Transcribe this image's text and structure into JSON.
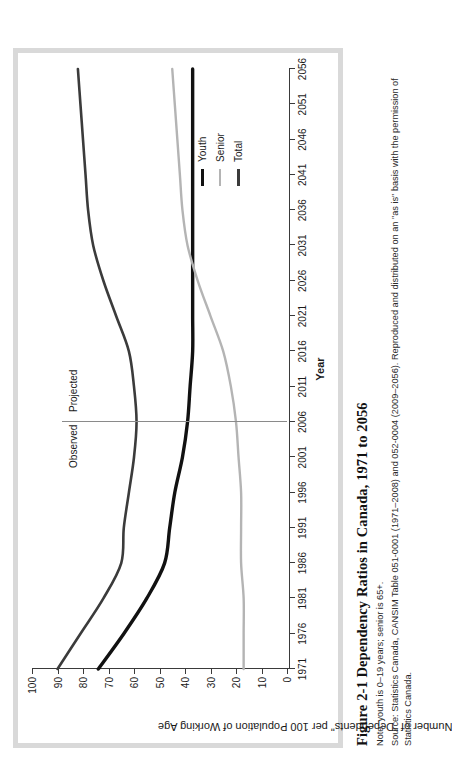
{
  "figure": {
    "title": "Figure 2-1  Dependency Ratios in Canada, 1971 to 2056",
    "note": "Note: youth is 0–19 years; senior is 65+.",
    "source": "Source: Statistics Canada, CANSIM Table 051-0001 (1971–2008) and 052-0004 (2009–2056). Reproduced and distributed on an \"as is\" basis with the permission of Statistics Canada."
  },
  "annotations": {
    "observed": "Observed",
    "projected": "Projected",
    "divider_year": 2006
  },
  "colors": {
    "total": "#3b3b3b",
    "youth": "#111111",
    "senior": "#b4b4b4",
    "axis": "#3a3a3a",
    "frame": "#d9d9d9",
    "divider": "#8a8a8a"
  },
  "chart_data": {
    "type": "line",
    "title": "Dependency Ratios in Canada, 1971 to 2056",
    "xlabel": "Year",
    "ylabel": "Number of \"Dependents\" per 100 Population of Working Age",
    "xlim": [
      1971,
      2056
    ],
    "ylim": [
      0,
      100
    ],
    "xticks": [
      1971,
      1976,
      1981,
      1986,
      1991,
      1996,
      2001,
      2006,
      2011,
      2016,
      2021,
      2026,
      2031,
      2036,
      2041,
      2046,
      2051,
      2056
    ],
    "yticks": [
      0,
      10,
      20,
      30,
      40,
      50,
      60,
      70,
      80,
      90,
      100
    ],
    "grid": false,
    "legend_position": "inside-right",
    "x": [
      1971,
      1976,
      1981,
      1986,
      1991,
      1996,
      2001,
      2006,
      2011,
      2016,
      2021,
      2026,
      2031,
      2036,
      2041,
      2046,
      2051,
      2056
    ],
    "series": [
      {
        "name": "Total",
        "color": "#3b3b3b",
        "values": [
          90,
          81,
          72,
          65,
          64,
          62,
          60,
          59,
          60,
          62,
          67,
          72,
          76,
          78,
          79,
          80,
          81,
          82
        ]
      },
      {
        "name": "Youth",
        "color": "#111111",
        "values": [
          74,
          64,
          55,
          48,
          46,
          44,
          41,
          39,
          38,
          37,
          37,
          37,
          37,
          37,
          37,
          37,
          37,
          37
        ]
      },
      {
        "name": "Senior",
        "color": "#b4b4b4",
        "values": [
          17,
          17,
          17,
          18,
          18,
          18,
          19,
          20,
          22,
          25,
          30,
          35,
          39,
          41,
          42,
          43,
          44,
          45
        ]
      }
    ]
  },
  "legend": {
    "items": [
      {
        "label": "Youth"
      },
      {
        "label": "Senior"
      },
      {
        "label": "Total"
      }
    ]
  }
}
